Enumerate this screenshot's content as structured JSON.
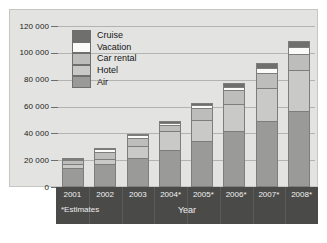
{
  "chart_data": {
    "type": "bar",
    "stacked": true,
    "title": "",
    "xlabel": "Year",
    "ylabel": "",
    "ylim": [
      0,
      120000
    ],
    "ytick_labels": [
      "120 000",
      "100 000",
      "80 000",
      "60 000",
      "40 000",
      "20 000",
      "0"
    ],
    "ytick_values": [
      120000,
      100000,
      80000,
      60000,
      40000,
      20000,
      0
    ],
    "grid": true,
    "legend_position": "inside top-left",
    "categories": [
      "2001",
      "2002",
      "2003",
      "2004*",
      "2005*",
      "2006*",
      "2007*",
      "2008*"
    ],
    "series": [
      {
        "name": "Air",
        "color": "#9a9a98",
        "values": [
          14000,
          17000,
          21500,
          27500,
          34000,
          42000,
          49000,
          57000
        ]
      },
      {
        "name": "Hotel",
        "color": "#c9c9c7",
        "values": [
          3000,
          4000,
          9000,
          14000,
          16000,
          20000,
          25000,
          30000
        ]
      },
      {
        "name": "Car rental",
        "color": "#bdbdbb",
        "values": [
          3000,
          5000,
          6000,
          5000,
          9000,
          10000,
          11000,
          12000
        ]
      },
      {
        "name": "Vacation",
        "color": "#fbfbfa",
        "values": [
          1000,
          2000,
          2000,
          1500,
          2000,
          2500,
          4000,
          5000
        ]
      },
      {
        "name": "Cruise",
        "color": "#6f6f6d",
        "values": [
          500,
          500,
          1000,
          1000,
          2000,
          3000,
          3500,
          4500
        ]
      }
    ],
    "totals": [
      21500,
      28500,
      39500,
      49000,
      63000,
      77500,
      92500,
      108500
    ],
    "legend_order_top_to_bottom": [
      "Cruise",
      "Vacation",
      "Car rental",
      "Hotel",
      "Air"
    ],
    "annotations": [
      "*Estimates"
    ]
  },
  "axis": {
    "x_title": "Year",
    "estimates_note": "*Estimates"
  },
  "caption": {
    "source_text": ""
  },
  "colors": {
    "panel_background": "#e3e3e1",
    "axis_band": "#4a4a48",
    "gridline": "#b3b3b1",
    "bar_outline": "#7d7d7b"
  }
}
